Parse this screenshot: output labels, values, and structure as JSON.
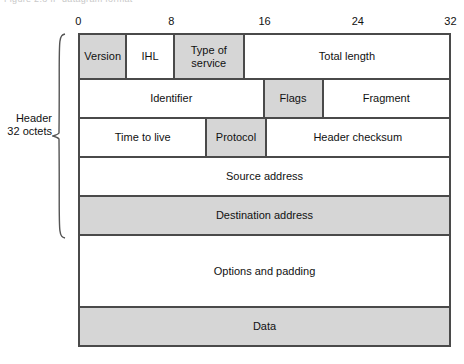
{
  "figure": {
    "caption_remnant": "Figure 2.8  IP datagram format",
    "left_annotation": {
      "line1": "Header",
      "line2": "32 octets"
    },
    "bit_ruler": {
      "ticks": [
        {
          "label": "0",
          "bit": 0
        },
        {
          "label": "8",
          "bit": 8
        },
        {
          "label": "16",
          "bit": 16
        },
        {
          "label": "24",
          "bit": 24
        },
        {
          "label": "32",
          "bit": 32
        }
      ],
      "total_bits": 32
    },
    "colors": {
      "shaded_field": "#d6d6d6",
      "unshaded_field": "#ffffff",
      "border": "#4a4a4a",
      "text": "#111111"
    },
    "rows": [
      {
        "name": "row-1",
        "height_class": "h-short",
        "fields": [
          {
            "label": "Version",
            "bits": 4,
            "shaded": true
          },
          {
            "label": "IHL",
            "bits": 4,
            "shaded": false
          },
          {
            "label": "Type of service",
            "bits": 6,
            "shaded": true
          },
          {
            "label": "Total length",
            "bits": 18,
            "shaded": false
          }
        ]
      },
      {
        "name": "row-2",
        "height_class": "h-row",
        "fields": [
          {
            "label": "Identifier",
            "bits": 16,
            "shaded": false
          },
          {
            "label": "Flags",
            "bits": 5,
            "shaded": true
          },
          {
            "label": "Fragment",
            "bits": 11,
            "shaded": false
          }
        ]
      },
      {
        "name": "row-3",
        "height_class": "h-row",
        "fields": [
          {
            "label": "Time to live",
            "bits": 11,
            "shaded": false
          },
          {
            "label": "Protocol",
            "bits": 5,
            "shaded": true
          },
          {
            "label": "Header checksum",
            "bits": 16,
            "shaded": false
          }
        ]
      },
      {
        "name": "row-4",
        "height_class": "h-row",
        "fields": [
          {
            "label": "Source address",
            "bits": 32,
            "shaded": false
          }
        ]
      },
      {
        "name": "row-5",
        "height_class": "h-row",
        "fields": [
          {
            "label": "Destination address",
            "bits": 32,
            "shaded": true
          }
        ]
      },
      {
        "name": "row-6",
        "height_class": "h-tall",
        "fields": [
          {
            "label": "Options and padding",
            "bits": 32,
            "shaded": false
          }
        ]
      },
      {
        "name": "row-7",
        "height_class": "h-row",
        "fields": [
          {
            "label": "Data",
            "bits": 32,
            "shaded": true
          }
        ]
      }
    ]
  }
}
